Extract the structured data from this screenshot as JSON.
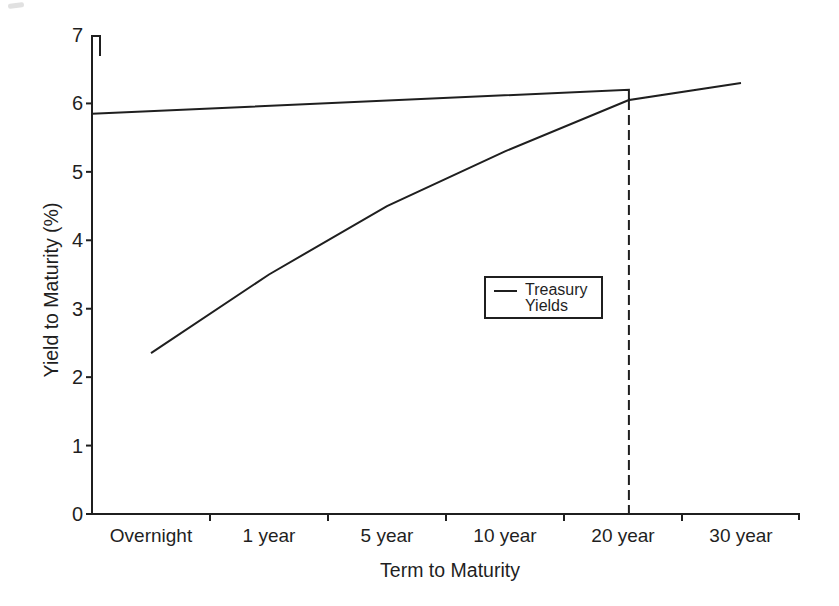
{
  "chart_data": {
    "type": "line",
    "title": "",
    "xlabel": "Term to Maturity",
    "ylabel": "Yield to Maturity (%)",
    "categories": [
      "Overnight",
      "1 year",
      "5 year",
      "10 year",
      "20 year",
      "30 year"
    ],
    "x_units_note": "x in category-interval units: 0 = y-axis, category i centered at i + 0.5",
    "yticks": [
      0,
      1,
      2,
      3,
      4,
      5,
      6,
      7
    ],
    "ylim": [
      0,
      7
    ],
    "grid": false,
    "line_color": "#1f1f1f",
    "series": [
      {
        "name": "Treasury Yields (upper line, small step down at 20 year)",
        "points": [
          [
            0,
            5.85
          ],
          [
            4.55,
            6.2
          ],
          [
            4.55,
            6.05
          ],
          [
            5.5,
            6.3
          ]
        ]
      },
      {
        "name": "Treasury Yields (rising curve from overnight to 20 year)",
        "points": [
          [
            0.5,
            2.35
          ],
          [
            1.5,
            3.5
          ],
          [
            2.5,
            4.5
          ],
          [
            3.5,
            5.3
          ],
          [
            4.55,
            6.05
          ]
        ]
      }
    ],
    "reference_line": {
      "style": "dashed",
      "x": 4.55,
      "y_from": 0,
      "y_to": 6.05
    },
    "legend": {
      "entries": [
        "Treasury Yields"
      ],
      "lines": [
        "Treasury",
        "Yields"
      ],
      "position": "center-right"
    }
  }
}
